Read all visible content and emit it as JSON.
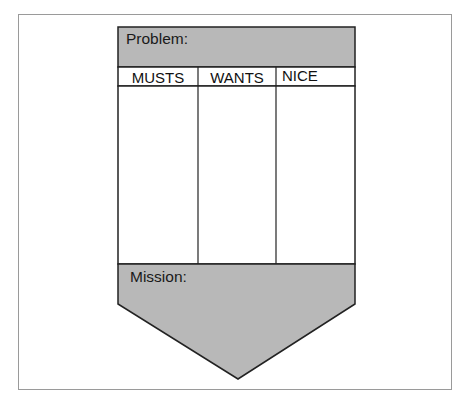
{
  "diagram": {
    "problem_label": "Problem:",
    "columns": [
      {
        "label": "MUSTS"
      },
      {
        "label": "WANTS"
      },
      {
        "label": "NICE"
      }
    ],
    "mission_label": "Mission:",
    "colors": {
      "fill_gray": "#b8b8b8",
      "stroke": "#222222",
      "frame": "#9a9a9a",
      "background": "#ffffff"
    }
  }
}
